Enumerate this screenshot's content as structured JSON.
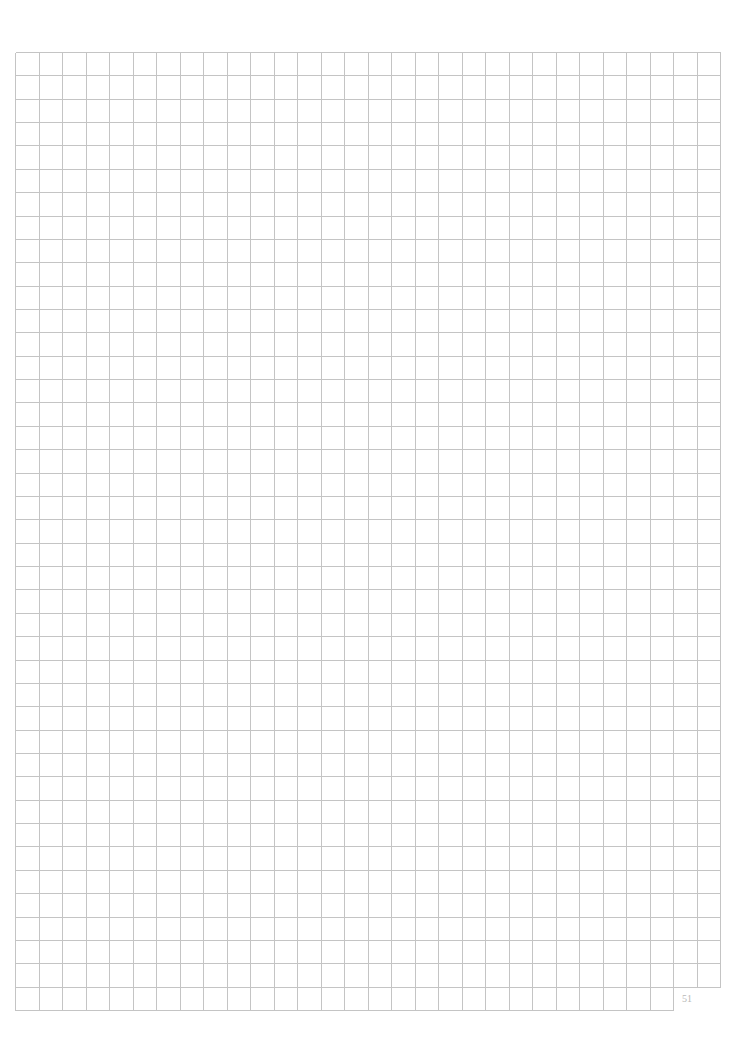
{
  "page": {
    "type": "graph-paper",
    "page_number": "51",
    "background": "#ffffff"
  },
  "grid": {
    "left": 15,
    "top": 52,
    "right": 720,
    "bottom": 1010,
    "columns": 30,
    "rows": 41,
    "last_row_columns": 28,
    "line_color": "#c4c4c4"
  }
}
